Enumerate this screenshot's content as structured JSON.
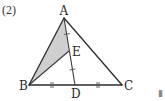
{
  "problem": {
    "number_label": "(2)"
  },
  "figure": {
    "points": {
      "A": {
        "label": "A",
        "x": 64,
        "y": 17
      },
      "B": {
        "label": "B",
        "x": 29,
        "y": 85
      },
      "C": {
        "label": "C",
        "x": 122,
        "y": 85
      },
      "D": {
        "label": "D",
        "x": 75,
        "y": 85
      },
      "E": {
        "label": "E",
        "x": 69,
        "y": 51
      }
    },
    "shaded_region": "ABE",
    "shade_color": "#cfcfcf",
    "line_color": "#2b2b2b",
    "segments": [
      "AB",
      "AC",
      "BC",
      "AD",
      "BE"
    ],
    "equal_marks": {
      "single": [
        "AE",
        "ED"
      ],
      "double": [
        "BD",
        "DC"
      ]
    }
  },
  "corner_glyph": "▮"
}
